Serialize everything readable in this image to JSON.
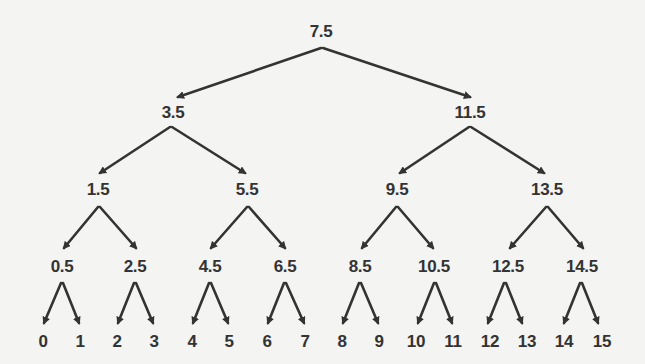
{
  "diagram": {
    "type": "binary-search-tree",
    "colors": {
      "background": "#f4f4f2",
      "text": "#333333",
      "edge": "#333333"
    },
    "nodes": [
      {
        "id": "n7_5",
        "label": "7.5",
        "x": 321,
        "y": 32,
        "level": 0
      },
      {
        "id": "n3_5",
        "label": "3.5",
        "x": 173,
        "y": 113,
        "level": 1
      },
      {
        "id": "n11_5",
        "label": "11.5",
        "x": 470,
        "y": 113,
        "level": 1
      },
      {
        "id": "n1_5",
        "label": "1.5",
        "x": 98,
        "y": 190,
        "level": 2
      },
      {
        "id": "n5_5",
        "label": "5.5",
        "x": 247,
        "y": 190,
        "level": 2
      },
      {
        "id": "n9_5",
        "label": "9.5",
        "x": 397,
        "y": 190,
        "level": 2
      },
      {
        "id": "n13_5",
        "label": "13.5",
        "x": 547,
        "y": 190,
        "level": 2
      },
      {
        "id": "n0_5",
        "label": "0.5",
        "x": 62,
        "y": 267,
        "level": 3
      },
      {
        "id": "n2_5",
        "label": "2.5",
        "x": 135,
        "y": 267,
        "level": 3
      },
      {
        "id": "n4_5",
        "label": "4.5",
        "x": 210,
        "y": 267,
        "level": 3
      },
      {
        "id": "n6_5",
        "label": "6.5",
        "x": 285,
        "y": 267,
        "level": 3
      },
      {
        "id": "n8_5",
        "label": "8.5",
        "x": 360,
        "y": 267,
        "level": 3
      },
      {
        "id": "n10_5",
        "label": "10.5",
        "x": 434,
        "y": 267,
        "level": 3
      },
      {
        "id": "n12_5",
        "label": "12.5",
        "x": 508,
        "y": 267,
        "level": 3
      },
      {
        "id": "n14_5",
        "label": "14.5",
        "x": 582,
        "y": 267,
        "level": 3
      },
      {
        "id": "n0",
        "label": "0",
        "x": 43,
        "y": 342,
        "level": 4
      },
      {
        "id": "n1",
        "label": "1",
        "x": 80,
        "y": 342,
        "level": 4
      },
      {
        "id": "n2",
        "label": "2",
        "x": 117,
        "y": 342,
        "level": 4
      },
      {
        "id": "n3",
        "label": "3",
        "x": 154,
        "y": 342,
        "level": 4
      },
      {
        "id": "n4",
        "label": "4",
        "x": 192,
        "y": 342,
        "level": 4
      },
      {
        "id": "n5",
        "label": "5",
        "x": 229,
        "y": 342,
        "level": 4
      },
      {
        "id": "n6",
        "label": "6",
        "x": 267,
        "y": 342,
        "level": 4
      },
      {
        "id": "n7",
        "label": "7",
        "x": 305,
        "y": 342,
        "level": 4
      },
      {
        "id": "n8",
        "label": "8",
        "x": 342,
        "y": 342,
        "level": 4
      },
      {
        "id": "n9",
        "label": "9",
        "x": 379,
        "y": 342,
        "level": 4
      },
      {
        "id": "n10",
        "label": "10",
        "x": 416,
        "y": 342,
        "level": 4
      },
      {
        "id": "n11",
        "label": "11",
        "x": 453,
        "y": 342,
        "level": 4
      },
      {
        "id": "n12",
        "label": "12",
        "x": 490,
        "y": 342,
        "level": 4
      },
      {
        "id": "n13",
        "label": "13",
        "x": 527,
        "y": 342,
        "level": 4
      },
      {
        "id": "n14",
        "label": "14",
        "x": 564,
        "y": 342,
        "level": 4
      },
      {
        "id": "n15",
        "label": "15",
        "x": 602,
        "y": 342,
        "level": 4
      }
    ],
    "edges": [
      {
        "from": "n7_5",
        "to": "n3_5",
        "x1": 321,
        "y1": 48,
        "x2": 178,
        "y2": 97
      },
      {
        "from": "n7_5",
        "to": "n11_5",
        "x1": 323,
        "y1": 48,
        "x2": 470,
        "y2": 97
      },
      {
        "from": "n3_5",
        "to": "n1_5",
        "x1": 170,
        "y1": 127,
        "x2": 100,
        "y2": 173
      },
      {
        "from": "n3_5",
        "to": "n5_5",
        "x1": 172,
        "y1": 127,
        "x2": 245,
        "y2": 173
      },
      {
        "from": "n11_5",
        "to": "n9_5",
        "x1": 469,
        "y1": 127,
        "x2": 400,
        "y2": 173
      },
      {
        "from": "n11_5",
        "to": "n13_5",
        "x1": 471,
        "y1": 127,
        "x2": 544,
        "y2": 173
      },
      {
        "from": "n1_5",
        "to": "n0_5",
        "x1": 98,
        "y1": 207,
        "x2": 64,
        "y2": 248
      },
      {
        "from": "n1_5",
        "to": "n2_5",
        "x1": 100,
        "y1": 207,
        "x2": 136,
        "y2": 248
      },
      {
        "from": "n5_5",
        "to": "n4_5",
        "x1": 247,
        "y1": 207,
        "x2": 211,
        "y2": 248
      },
      {
        "from": "n5_5",
        "to": "n6_5",
        "x1": 249,
        "y1": 207,
        "x2": 285,
        "y2": 248
      },
      {
        "from": "n9_5",
        "to": "n8_5",
        "x1": 396,
        "y1": 207,
        "x2": 362,
        "y2": 248
      },
      {
        "from": "n9_5",
        "to": "n10_5",
        "x1": 398,
        "y1": 207,
        "x2": 433,
        "y2": 248
      },
      {
        "from": "n13_5",
        "to": "n12_5",
        "x1": 546,
        "y1": 207,
        "x2": 510,
        "y2": 248
      },
      {
        "from": "n13_5",
        "to": "n14_5",
        "x1": 548,
        "y1": 207,
        "x2": 583,
        "y2": 248
      },
      {
        "from": "n0_5",
        "to": "n0",
        "x1": 61,
        "y1": 283,
        "x2": 44,
        "y2": 323
      },
      {
        "from": "n0_5",
        "to": "n1",
        "x1": 63,
        "y1": 283,
        "x2": 79,
        "y2": 323
      },
      {
        "from": "n2_5",
        "to": "n2",
        "x1": 134,
        "y1": 283,
        "x2": 118,
        "y2": 323
      },
      {
        "from": "n2_5",
        "to": "n3",
        "x1": 136,
        "y1": 283,
        "x2": 153,
        "y2": 323
      },
      {
        "from": "n4_5",
        "to": "n4",
        "x1": 209,
        "y1": 283,
        "x2": 193,
        "y2": 323
      },
      {
        "from": "n4_5",
        "to": "n5",
        "x1": 211,
        "y1": 283,
        "x2": 228,
        "y2": 323
      },
      {
        "from": "n6_5",
        "to": "n6",
        "x1": 284,
        "y1": 283,
        "x2": 268,
        "y2": 323
      },
      {
        "from": "n6_5",
        "to": "n7",
        "x1": 286,
        "y1": 283,
        "x2": 304,
        "y2": 323
      },
      {
        "from": "n8_5",
        "to": "n8",
        "x1": 359,
        "y1": 283,
        "x2": 343,
        "y2": 323
      },
      {
        "from": "n8_5",
        "to": "n9",
        "x1": 361,
        "y1": 283,
        "x2": 378,
        "y2": 323
      },
      {
        "from": "n10_5",
        "to": "n10",
        "x1": 434,
        "y1": 283,
        "x2": 418,
        "y2": 323
      },
      {
        "from": "n10_5",
        "to": "n11",
        "x1": 436,
        "y1": 283,
        "x2": 452,
        "y2": 323
      },
      {
        "from": "n12_5",
        "to": "n12",
        "x1": 504,
        "y1": 283,
        "x2": 488,
        "y2": 323
      },
      {
        "from": "n12_5",
        "to": "n13",
        "x1": 506,
        "y1": 283,
        "x2": 522,
        "y2": 323
      },
      {
        "from": "n14_5",
        "to": "n14",
        "x1": 580,
        "y1": 283,
        "x2": 564,
        "y2": 323
      },
      {
        "from": "n14_5",
        "to": "n15",
        "x1": 582,
        "y1": 283,
        "x2": 598,
        "y2": 323
      }
    ]
  }
}
